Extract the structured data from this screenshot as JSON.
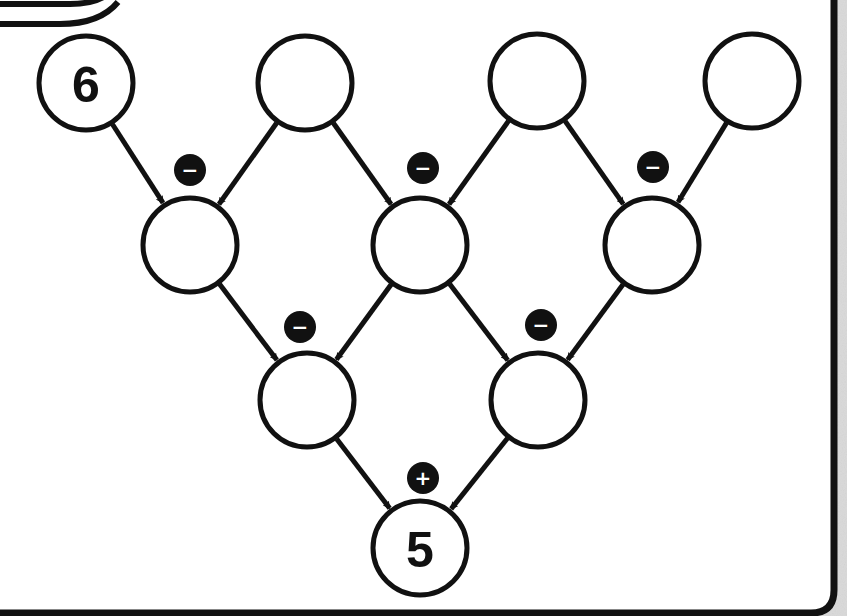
{
  "puzzle": {
    "type": "arithmetic-pyramid",
    "colors": {
      "ink": "#111111",
      "paper": "#ffffff",
      "margin": "#d9d9d9"
    },
    "nodes": [
      {
        "id": "r1c1",
        "row": 1,
        "x": 86,
        "y": 83,
        "value": "6"
      },
      {
        "id": "r1c2",
        "row": 1,
        "x": 305,
        "y": 83,
        "value": ""
      },
      {
        "id": "r1c3",
        "row": 1,
        "x": 537,
        "y": 81,
        "value": ""
      },
      {
        "id": "r1c4",
        "row": 1,
        "x": 752,
        "y": 81,
        "value": ""
      },
      {
        "id": "r2c1",
        "row": 2,
        "x": 190,
        "y": 245,
        "value": ""
      },
      {
        "id": "r2c2",
        "row": 2,
        "x": 420,
        "y": 245,
        "value": ""
      },
      {
        "id": "r2c3",
        "row": 2,
        "x": 652,
        "y": 245,
        "value": ""
      },
      {
        "id": "r3c1",
        "row": 3,
        "x": 307,
        "y": 400,
        "value": ""
      },
      {
        "id": "r3c2",
        "row": 3,
        "x": 538,
        "y": 400,
        "value": ""
      },
      {
        "id": "r4c1",
        "row": 4,
        "x": 420,
        "y": 548,
        "value": "5"
      }
    ],
    "operators": [
      {
        "id": "op-r2c1",
        "x": 190,
        "y": 170,
        "symbol": "−",
        "name": "minus"
      },
      {
        "id": "op-r2c2",
        "x": 423,
        "y": 168,
        "symbol": "−",
        "name": "minus"
      },
      {
        "id": "op-r2c3",
        "x": 653,
        "y": 167,
        "symbol": "−",
        "name": "minus"
      },
      {
        "id": "op-r3c1",
        "x": 300,
        "y": 327,
        "symbol": "−",
        "name": "minus"
      },
      {
        "id": "op-r3c2",
        "x": 541,
        "y": 325,
        "symbol": "−",
        "name": "minus"
      },
      {
        "id": "op-r4c1",
        "x": 423,
        "y": 478,
        "symbol": "+",
        "name": "plus"
      }
    ],
    "edges": [
      [
        "r1c1",
        "r2c1"
      ],
      [
        "r1c2",
        "r2c1"
      ],
      [
        "r1c2",
        "r2c2"
      ],
      [
        "r1c3",
        "r2c2"
      ],
      [
        "r1c3",
        "r2c3"
      ],
      [
        "r1c4",
        "r2c3"
      ],
      [
        "r2c1",
        "r3c1"
      ],
      [
        "r2c2",
        "r3c1"
      ],
      [
        "r2c2",
        "r3c2"
      ],
      [
        "r2c3",
        "r3c2"
      ],
      [
        "r3c1",
        "r4c1"
      ],
      [
        "r3c2",
        "r4c1"
      ]
    ]
  }
}
